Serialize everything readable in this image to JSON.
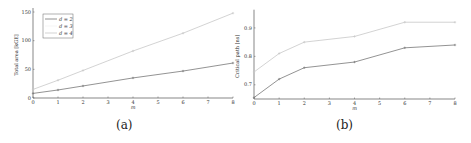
{
  "chart_data": [
    {
      "type": "line",
      "panel": "(a)",
      "title": "",
      "xlabel": "m",
      "ylabel": "Total area [kGE]",
      "x": [
        0,
        1,
        2,
        4,
        6,
        8
      ],
      "xticks": [
        0,
        1,
        2,
        3,
        4,
        5,
        6,
        7,
        8
      ],
      "yticks": [
        0,
        50,
        100,
        150
      ],
      "xlim": [
        0,
        8
      ],
      "ylim": [
        0,
        150
      ],
      "grid": false,
      "legend_position": "upper left",
      "series": [
        {
          "name": "d = 2",
          "color": "#777777",
          "values": [
            8,
            14,
            21,
            35,
            47,
            61
          ]
        },
        {
          "name": "d = 3",
          "color": "#f2f2f2",
          "values": [
            null,
            null,
            null,
            null,
            null,
            null
          ]
        },
        {
          "name": "d = 4",
          "color": "#c8c8c8",
          "values": [
            15,
            31,
            48,
            82,
            113,
            148
          ]
        }
      ]
    },
    {
      "type": "line",
      "panel": "(b)",
      "title": "",
      "xlabel": "m",
      "ylabel": "Critical path [ns]",
      "x": [
        0,
        1,
        2,
        4,
        6,
        8
      ],
      "xticks": [
        0,
        1,
        2,
        3,
        4,
        5,
        6,
        7,
        8
      ],
      "yticks": [
        0.7,
        0.8,
        0.9
      ],
      "xlim": [
        0,
        8
      ],
      "ylim": [
        0.65,
        0.95
      ],
      "grid": false,
      "series": [
        {
          "name": "d = 2",
          "color": "#777777",
          "values": [
            0.655,
            0.72,
            0.76,
            0.78,
            0.83,
            0.84
          ]
        },
        {
          "name": "d = 4",
          "color": "#c8c8c8",
          "values": [
            0.745,
            0.81,
            0.85,
            0.87,
            0.92,
            0.92
          ]
        }
      ]
    }
  ],
  "captions": {
    "a": "(a)",
    "b": "(b)"
  },
  "legend": {
    "items": [
      "d = 2",
      "d = 3",
      "d = 4"
    ]
  }
}
